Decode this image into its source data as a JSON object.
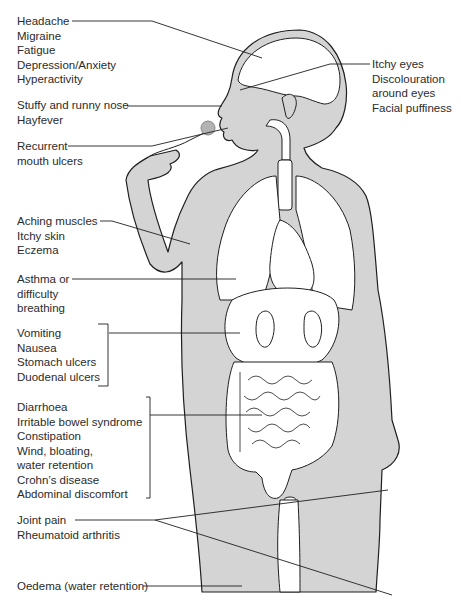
{
  "diagram": {
    "type": "anatomical symptom map",
    "colors": {
      "skin": "#d4d4d4",
      "organs": "#ffffff",
      "outline": "#1f1f1f",
      "ulcer_marker": "#b3b3b3"
    },
    "labels": {
      "head": [
        "Headache",
        "Migraine",
        "Fatigue",
        "Depression/Anxiety",
        "Hyperactivity"
      ],
      "nose": [
        "Stuffy and runny nose",
        "Hayfever"
      ],
      "mouth": [
        "Recurrent",
        "mouth ulcers"
      ],
      "eyes": [
        "Itchy eyes",
        "Discolouration",
        "around eyes",
        "Facial puffiness"
      ],
      "skin": [
        "Aching muscles",
        "Itchy skin",
        "Eczema"
      ],
      "lungs": [
        "Asthma or",
        "difficulty",
        "breathing"
      ],
      "stomach": [
        "Vomiting",
        "Nausea",
        "Stomach ulcers",
        "Duodenal ulcers"
      ],
      "bowel": [
        "Diarrhoea",
        "Irritable bowel syndrome",
        "Constipation",
        "Wind, bloating,",
        "water retention",
        "Crohn’s disease",
        "Abdominal discomfort"
      ],
      "joints": [
        "Joint pain",
        "Rheumatoid arthritis"
      ],
      "legs": [
        "Oedema (water retention)"
      ]
    }
  }
}
